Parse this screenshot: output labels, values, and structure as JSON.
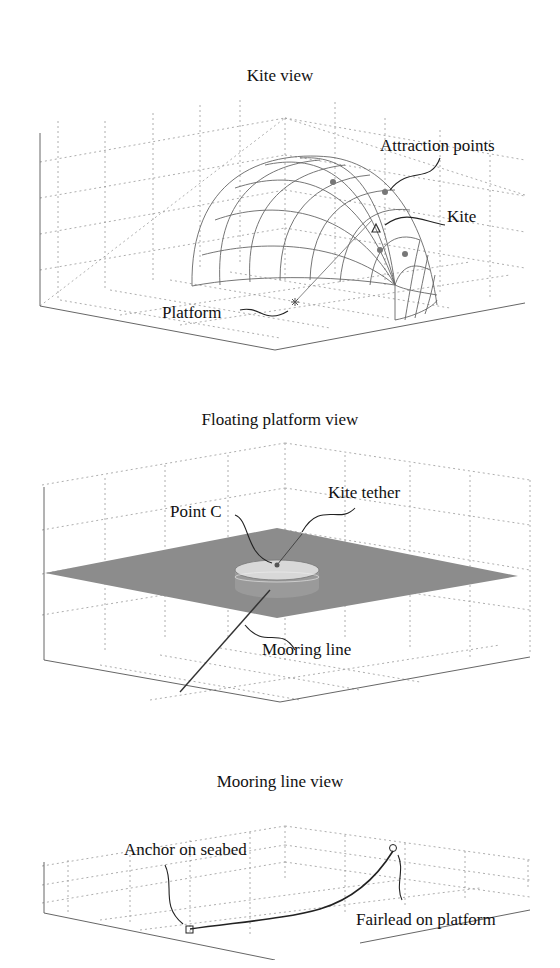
{
  "panels": [
    {
      "title": "Kite view",
      "annotations": {
        "attraction_points": "Attraction points",
        "kite": "Kite",
        "platform": "Platform"
      }
    },
    {
      "title": "Floating platform view",
      "annotations": {
        "point_c": "Point C",
        "kite_tether": "Kite tether",
        "mooring_line": "Mooring line"
      }
    },
    {
      "title": "Mooring line view",
      "annotations": {
        "anchor": "Anchor on seabed",
        "fairlead": "Fairlead on platform"
      }
    }
  ],
  "colors": {
    "sea_surface": "#8c8c8c",
    "platform_top": "#d8d8d8",
    "platform_side": "#9a9a9a"
  }
}
